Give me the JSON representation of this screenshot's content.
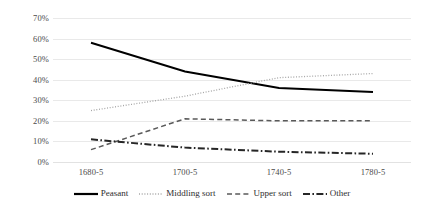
{
  "chart_data": {
    "type": "line",
    "title": "",
    "xlabel": "",
    "ylabel": "",
    "categories": [
      "1680-5",
      "1700-5",
      "1740-5",
      "1780-5"
    ],
    "ylim": [
      0,
      70
    ],
    "ytick_labels": [
      "0%",
      "10%",
      "20%",
      "30%",
      "40%",
      "50%",
      "60%",
      "70%"
    ],
    "ytick_values": [
      0,
      10,
      20,
      30,
      40,
      50,
      60,
      70
    ],
    "grid": true,
    "legend_position": "bottom",
    "series": [
      {
        "name": "Peasant",
        "style": "solid",
        "color": "#000000",
        "values": [
          58,
          44,
          36,
          34
        ]
      },
      {
        "name": "Middling sort",
        "style": "dotted",
        "color": "#a6a6a6",
        "values": [
          25,
          32,
          41,
          43
        ]
      },
      {
        "name": "Upper sort",
        "style": "dashed",
        "color": "#595959",
        "values": [
          6,
          21,
          20,
          20
        ]
      },
      {
        "name": "Other",
        "style": "dashdot",
        "color": "#262626",
        "values": [
          11,
          7,
          5,
          4
        ]
      }
    ]
  },
  "axis": {
    "y_labels": [
      "70%",
      "60%",
      "50%",
      "40%",
      "30%",
      "20%",
      "10%",
      "0%"
    ],
    "x_labels": [
      "1680-5",
      "1700-5",
      "1740-5",
      "1780-5"
    ]
  },
  "legend": {
    "items": [
      {
        "label": "Peasant"
      },
      {
        "label": "Middling sort"
      },
      {
        "label": "Upper sort"
      },
      {
        "label": "Other"
      }
    ]
  }
}
